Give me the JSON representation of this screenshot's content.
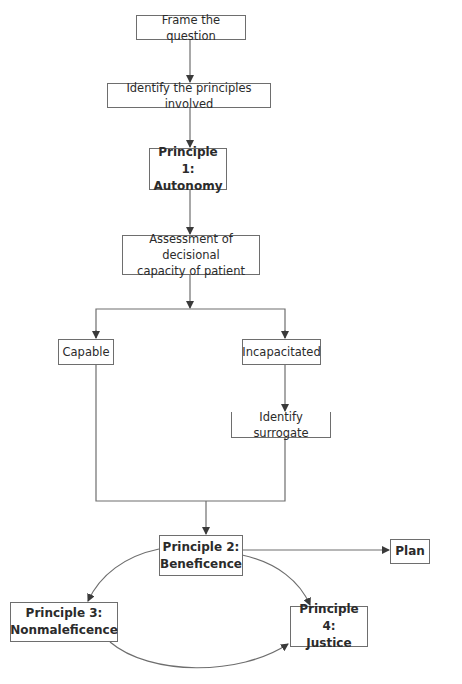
{
  "diagram": {
    "type": "flowchart",
    "colors": {
      "line": "#6e6e6e",
      "text": "#2b2b2b",
      "background": "#ffffff"
    },
    "nodes": {
      "frame": {
        "label": "Frame the question"
      },
      "identify": {
        "label": "Identify the principles involved"
      },
      "p1": {
        "line1": "Principle 1:",
        "line2": "Autonomy"
      },
      "assess": {
        "line1": "Assessment of decisional",
        "line2": "capacity of patient"
      },
      "capable": {
        "label": "Capable"
      },
      "incap": {
        "label": "Incapacitated"
      },
      "surrogate": {
        "label": "Identify surrogate"
      },
      "p2": {
        "line1": "Principle 2:",
        "line2": "Beneficence"
      },
      "plan": {
        "label": "Plan"
      },
      "p3": {
        "line1": "Principle 3:",
        "line2": "Nonmaleficence"
      },
      "p4": {
        "line1": "Principle 4:",
        "line2": "Justice"
      }
    },
    "edges": [
      {
        "from": "Frame the question",
        "to": "Identify the principles involved"
      },
      {
        "from": "Identify the principles involved",
        "to": "Principle 1: Autonomy"
      },
      {
        "from": "Principle 1: Autonomy",
        "to": "Assessment of decisional capacity of patient"
      },
      {
        "from": "Assessment of decisional capacity of patient",
        "to": "Capable"
      },
      {
        "from": "Assessment of decisional capacity of patient",
        "to": "Incapacitated"
      },
      {
        "from": "Incapacitated",
        "to": "Identify surrogate"
      },
      {
        "from": "Capable",
        "to": "Principle 2: Beneficence"
      },
      {
        "from": "Identify surrogate",
        "to": "Principle 2: Beneficence"
      },
      {
        "from": "Principle 2: Beneficence",
        "to": "Plan"
      },
      {
        "from": "Principle 2: Beneficence",
        "to": "Principle 3: Nonmaleficence"
      },
      {
        "from": "Principle 2: Beneficence",
        "to": "Principle 4: Justice"
      },
      {
        "from": "Principle 3: Nonmaleficence",
        "to": "Principle 4: Justice"
      }
    ]
  }
}
